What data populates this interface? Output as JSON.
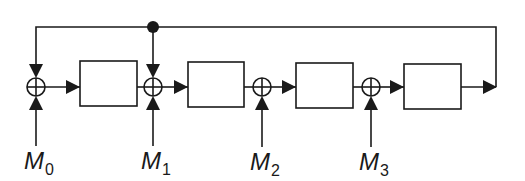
{
  "diagram": {
    "type": "block-diagram",
    "colors": {
      "stroke": "#1a1a1a",
      "background": "#ffffff"
    },
    "inputs": [
      {
        "id": "M0",
        "symbol": "M",
        "subscript": "0"
      },
      {
        "id": "M1",
        "symbol": "M",
        "subscript": "1"
      },
      {
        "id": "M2",
        "symbol": "M",
        "subscript": "2"
      },
      {
        "id": "M3",
        "symbol": "M",
        "subscript": "3"
      }
    ],
    "adders": [
      {
        "id": "sum0",
        "inputs": [
          "feedback",
          "M0"
        ]
      },
      {
        "id": "sum1",
        "inputs": [
          "block1",
          "feedback",
          "M1"
        ]
      },
      {
        "id": "sum2",
        "inputs": [
          "block2",
          "M2"
        ]
      },
      {
        "id": "sum3",
        "inputs": [
          "block3",
          "M3"
        ]
      }
    ],
    "blocks": [
      {
        "id": "block1",
        "label": ""
      },
      {
        "id": "block2",
        "label": ""
      },
      {
        "id": "block3",
        "label": ""
      },
      {
        "id": "block4",
        "label": ""
      }
    ],
    "feedback": {
      "from": "block4-output",
      "to": [
        "sum0",
        "sum1"
      ],
      "junction_dot": true
    }
  }
}
